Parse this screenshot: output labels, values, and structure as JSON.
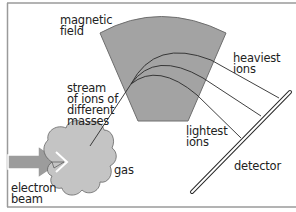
{
  "diagram": {
    "labels": {
      "magnetic_field": "magnetic\nfield",
      "stream": "stream\nof ions of\ndifferent\nmasses",
      "heaviest": "heaviest\nions",
      "lightest": "lightest\nions",
      "detector": "detector",
      "gas": "gas",
      "electron_beam": "electron\nbeam"
    },
    "colors": {
      "background": "#ffffff",
      "frame": "#9a9a9a",
      "magnet": "#a3a3a3",
      "magnet_edge": "#6e6e6e",
      "gas_cloud": "#c4c4c4",
      "arrow": "#9c9c9c",
      "line": "#2a2a2a"
    }
  }
}
